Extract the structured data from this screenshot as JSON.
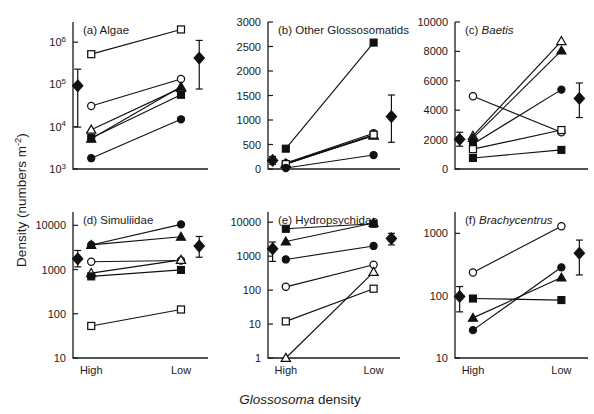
{
  "figure": {
    "width": 594,
    "height": 414,
    "background": "#ffffff",
    "ink": "#1a1a1a",
    "y_axis_title_main": "Density (numbers m",
    "y_axis_title_sup": "-2",
    "y_axis_title_tail": ")",
    "x_axis_title_italic": "Glossosoma",
    "x_axis_title_plain": " density",
    "x_categories": [
      "High",
      "Low"
    ]
  },
  "chart_data": [
    {
      "id": "panel-a",
      "type": "line",
      "title": "(a) Algae",
      "title_italic_part": "",
      "scale": "log",
      "xlabel": "Glossosoma density",
      "ylabel": "Density (numbers m-2)",
      "categories": [
        "High",
        "Low"
      ],
      "ylim": [
        1000,
        3000000
      ],
      "yticks": [
        1000,
        10000,
        100000,
        1000000
      ],
      "ytick_labels": [
        "10^3",
        "10^4",
        "10^5",
        "10^6"
      ],
      "grid": false,
      "legend": "none",
      "series": [
        {
          "name": "open-square",
          "marker": "open-square",
          "values": [
            520000,
            2000000
          ]
        },
        {
          "name": "open-circle",
          "marker": "open-circle",
          "values": [
            31000,
            135000
          ]
        },
        {
          "name": "open-triangle",
          "marker": "open-triangle",
          "values": [
            8500,
            83000
          ]
        },
        {
          "name": "filled-triangle",
          "marker": "filled-triangle",
          "values": [
            5200,
            88000
          ]
        },
        {
          "name": "filled-square",
          "marker": "filled-square",
          "values": [
            5400,
            57000
          ]
        },
        {
          "name": "filled-circle",
          "marker": "filled-circle",
          "values": [
            1800,
            15000
          ]
        }
      ],
      "mean": {
        "marker": "filled-diamond",
        "values": [
          93000,
          420000
        ],
        "err_upper": [
          230000,
          1100000
        ],
        "err_lower": [
          9800,
          78000
        ]
      }
    },
    {
      "id": "panel-b",
      "type": "line",
      "title": "(b) Other Glossosomatids",
      "title_italic_part": "",
      "scale": "linear",
      "categories": [
        "High",
        "Low"
      ],
      "ylim": [
        0,
        3000
      ],
      "yticks": [
        0,
        500,
        1000,
        1500,
        2000,
        2500,
        3000
      ],
      "ytick_labels": [
        "0",
        "500",
        "1000",
        "1500",
        "2000",
        "2500",
        "3000"
      ],
      "grid": false,
      "legend": "none",
      "series": [
        {
          "name": "filled-square",
          "marker": "filled-square",
          "values": [
            415,
            2580
          ]
        },
        {
          "name": "open-circle",
          "marker": "open-circle",
          "values": [
            120,
            730
          ]
        },
        {
          "name": "open-triangle",
          "marker": "open-triangle",
          "values": [
            110,
            690
          ]
        },
        {
          "name": "filled-triangle",
          "marker": "filled-triangle",
          "values": [
            105,
            680
          ]
        },
        {
          "name": "open-square",
          "marker": "open-square",
          "values": [
            100,
            700
          ]
        },
        {
          "name": "filled-circle",
          "marker": "filled-circle",
          "values": [
            20,
            285
          ]
        }
      ],
      "mean": {
        "marker": "filled-diamond",
        "values": [
          175,
          1070
        ],
        "err_upper": [
          255,
          1510
        ],
        "err_lower": [
          95,
          545
        ]
      }
    },
    {
      "id": "panel-c",
      "type": "line",
      "title": "(c) ",
      "title_italic_part": "Baetis",
      "scale": "linear",
      "categories": [
        "High",
        "Low"
      ],
      "ylim": [
        0,
        10000
      ],
      "yticks": [
        0,
        2000,
        4000,
        6000,
        8000,
        10000
      ],
      "ytick_labels": [
        "0",
        "2000",
        "4000",
        "6000",
        "8000",
        "10000"
      ],
      "grid": false,
      "legend": "none",
      "series": [
        {
          "name": "open-triangle",
          "marker": "open-triangle",
          "values": [
            2250,
            8700
          ]
        },
        {
          "name": "filled-triangle",
          "marker": "filled-triangle",
          "values": [
            2100,
            8050
          ]
        },
        {
          "name": "filled-circle",
          "marker": "filled-circle",
          "values": [
            1700,
            5400
          ]
        },
        {
          "name": "open-circle",
          "marker": "open-circle",
          "values": [
            4950,
            2500
          ]
        },
        {
          "name": "open-square",
          "marker": "open-square",
          "values": [
            1350,
            2650
          ]
        },
        {
          "name": "filled-square",
          "marker": "filled-square",
          "values": [
            750,
            1300
          ]
        }
      ],
      "mean": {
        "marker": "filled-diamond",
        "values": [
          2020,
          4800
        ],
        "err_upper": [
          2500,
          5850
        ],
        "err_lower": [
          1550,
          3500
        ]
      }
    },
    {
      "id": "panel-d",
      "type": "line",
      "title": "(d) Simuliidae",
      "title_italic_part": "",
      "scale": "log",
      "categories": [
        "High",
        "Low"
      ],
      "ylim": [
        10,
        20000
      ],
      "yticks": [
        10,
        100,
        1000,
        10000
      ],
      "ytick_labels": [
        "10",
        "100",
        "1000",
        "10000"
      ],
      "grid": false,
      "legend": "none",
      "series": [
        {
          "name": "filled-circle",
          "marker": "filled-circle",
          "values": [
            3600,
            10500
          ]
        },
        {
          "name": "filled-triangle",
          "marker": "filled-triangle",
          "values": [
            3600,
            5500
          ]
        },
        {
          "name": "open-circle",
          "marker": "open-circle",
          "values": [
            1500,
            1600
          ]
        },
        {
          "name": "open-triangle",
          "marker": "open-triangle",
          "values": [
            830,
            1650
          ]
        },
        {
          "name": "filled-square",
          "marker": "filled-square",
          "values": [
            700,
            980
          ]
        },
        {
          "name": "open-square",
          "marker": "open-square",
          "values": [
            53,
            125
          ]
        }
      ],
      "mean": {
        "marker": "filled-diamond",
        "values": [
          1750,
          3400
        ],
        "err_upper": [
          2700,
          5600
        ],
        "err_lower": [
          1150,
          1900
        ]
      }
    },
    {
      "id": "panel-e",
      "type": "line",
      "title": "(e) Hydropsychidae",
      "title_italic_part": "",
      "scale": "log",
      "categories": [
        "High",
        "Low"
      ],
      "ylim": [
        1,
        20000
      ],
      "yticks": [
        1,
        10,
        100,
        1000,
        10000
      ],
      "ytick_labels": [
        "1",
        "10",
        "100",
        "1000",
        "10000"
      ],
      "grid": false,
      "legend": "none",
      "series": [
        {
          "name": "filled-square",
          "marker": "filled-square",
          "values": [
            6400,
            9000
          ]
        },
        {
          "name": "filled-triangle",
          "marker": "filled-triangle",
          "values": [
            2700,
            9500
          ]
        },
        {
          "name": "filled-circle",
          "marker": "filled-circle",
          "values": [
            800,
            2000
          ]
        },
        {
          "name": "open-circle",
          "marker": "open-circle",
          "values": [
            125,
            560
          ]
        },
        {
          "name": "open-square",
          "marker": "open-square",
          "values": [
            12,
            110
          ]
        },
        {
          "name": "open-triangle",
          "marker": "open-triangle",
          "values": [
            1,
            340
          ]
        }
      ],
      "mean": {
        "marker": "filled-diamond",
        "values": [
          1650,
          3300
        ],
        "err_upper": [
          2600,
          4700
        ],
        "err_lower": [
          700,
          2150
        ]
      }
    },
    {
      "id": "panel-f",
      "type": "line",
      "title": "(f) ",
      "title_italic_part": "Brachycentrus",
      "scale": "log",
      "categories": [
        "High",
        "Low"
      ],
      "ylim": [
        10,
        2200
      ],
      "yticks": [
        10,
        100,
        1000
      ],
      "ytick_labels": [
        "10",
        "100",
        "1000"
      ],
      "grid": false,
      "legend": "none",
      "series": [
        {
          "name": "open-circle",
          "marker": "open-circle",
          "values": [
            235,
            1300
          ]
        },
        {
          "name": "filled-square",
          "marker": "filled-square",
          "values": [
            90,
            85
          ]
        },
        {
          "name": "filled-circle",
          "marker": "filled-circle",
          "values": [
            28,
            285
          ]
        },
        {
          "name": "filled-triangle",
          "marker": "filled-triangle",
          "values": [
            44,
            195
          ]
        }
      ],
      "mean": {
        "marker": "filled-diamond",
        "values": [
          97,
          480
        ],
        "err_upper": [
          140,
          780
        ],
        "err_lower": [
          55,
          215
        ]
      }
    }
  ]
}
